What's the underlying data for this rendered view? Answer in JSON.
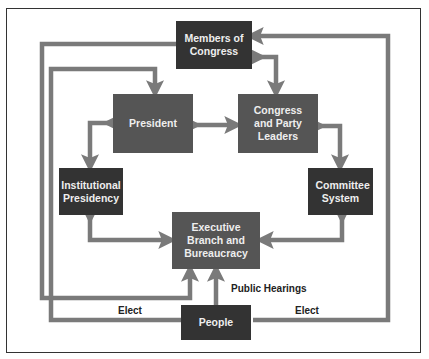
{
  "diagram": {
    "nodes": {
      "members": "Members of Congress",
      "president": "President",
      "congress_leaders": "Congress and Party Leaders",
      "institutional": "Institutional Presidency",
      "committee": "Committee System",
      "executive": "Executive Branch and Bureaucracy",
      "people": "People"
    },
    "edge_labels": {
      "elect_left": "Elect",
      "elect_right": "Elect",
      "public_hearings": "Public Hearings"
    },
    "edges": [
      {
        "from": "members",
        "to": "executive",
        "route": "left-outer"
      },
      {
        "from": "people",
        "to": "president",
        "route": "left-inner",
        "label": "Elect"
      },
      {
        "from": "people",
        "to": "members",
        "route": "right-outer",
        "label": "Elect"
      },
      {
        "from": "people",
        "to": "executive",
        "label": "Public Hearings"
      },
      {
        "from": "members",
        "to": "congress_leaders",
        "bidirectional": true
      },
      {
        "from": "president",
        "to": "congress_leaders",
        "bidirectional": true
      },
      {
        "from": "president",
        "to": "institutional",
        "bidirectional": true
      },
      {
        "from": "congress_leaders",
        "to": "committee",
        "bidirectional": true
      },
      {
        "from": "institutional",
        "to": "executive",
        "bidirectional": true
      },
      {
        "from": "committee",
        "to": "executive",
        "bidirectional": true
      }
    ],
    "colors": {
      "box_dark": "#333333",
      "box_mid": "#555555",
      "arrow": "#7a7a7a",
      "text": "#eeeeee"
    }
  }
}
